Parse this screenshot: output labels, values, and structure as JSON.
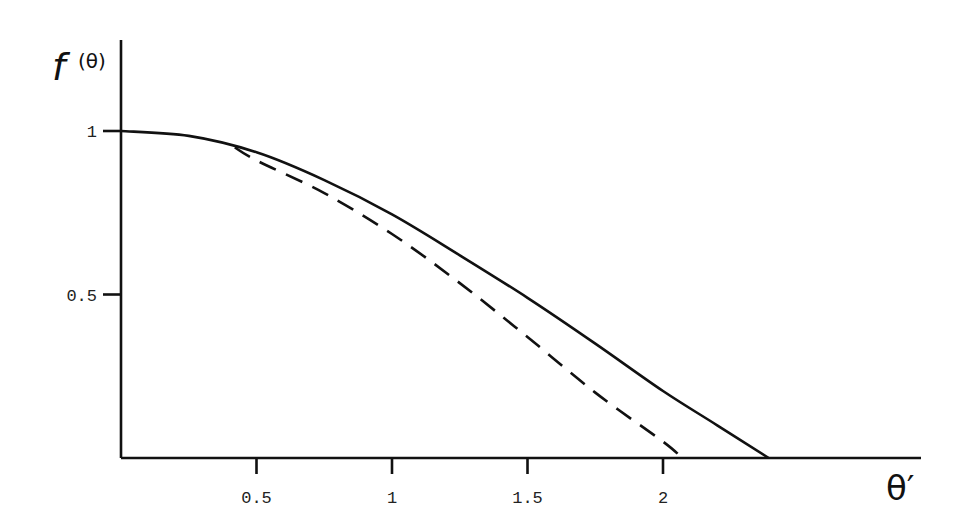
{
  "chart_data": {
    "type": "line",
    "title": "",
    "xlabel": "θ′",
    "ylabel": "f(θ)",
    "xlim": [
      0,
      2.95
    ],
    "ylim": [
      0,
      1.28
    ],
    "grid": false,
    "legend": null,
    "x_ticks": [
      {
        "value": 0.5,
        "label": "0.5"
      },
      {
        "value": 1,
        "label": "1"
      },
      {
        "value": 1.5,
        "label": "1.5"
      },
      {
        "value": 2,
        "label": "2"
      }
    ],
    "y_ticks": [
      {
        "value": 1,
        "label": "1"
      },
      {
        "value": 0.5,
        "label": "0.5"
      }
    ],
    "series": [
      {
        "name": "solid",
        "style": "solid",
        "x": [
          0,
          0.25,
          0.5,
          0.75,
          1.0,
          1.25,
          1.5,
          1.75,
          2.0,
          2.2,
          2.39
        ],
        "y": [
          1.0,
          0.985,
          0.935,
          0.85,
          0.745,
          0.62,
          0.49,
          0.35,
          0.205,
          0.1,
          0.0
        ]
      },
      {
        "name": "dashed",
        "style": "dashed",
        "x": [
          0.42,
          0.5,
          0.75,
          1.0,
          1.25,
          1.5,
          1.75,
          2.0,
          2.07
        ],
        "y": [
          0.95,
          0.91,
          0.81,
          0.685,
          0.535,
          0.37,
          0.2,
          0.05,
          0.0
        ]
      }
    ],
    "colors": {
      "line": "#111111",
      "axis": "#111111",
      "background": "#ffffff"
    }
  }
}
